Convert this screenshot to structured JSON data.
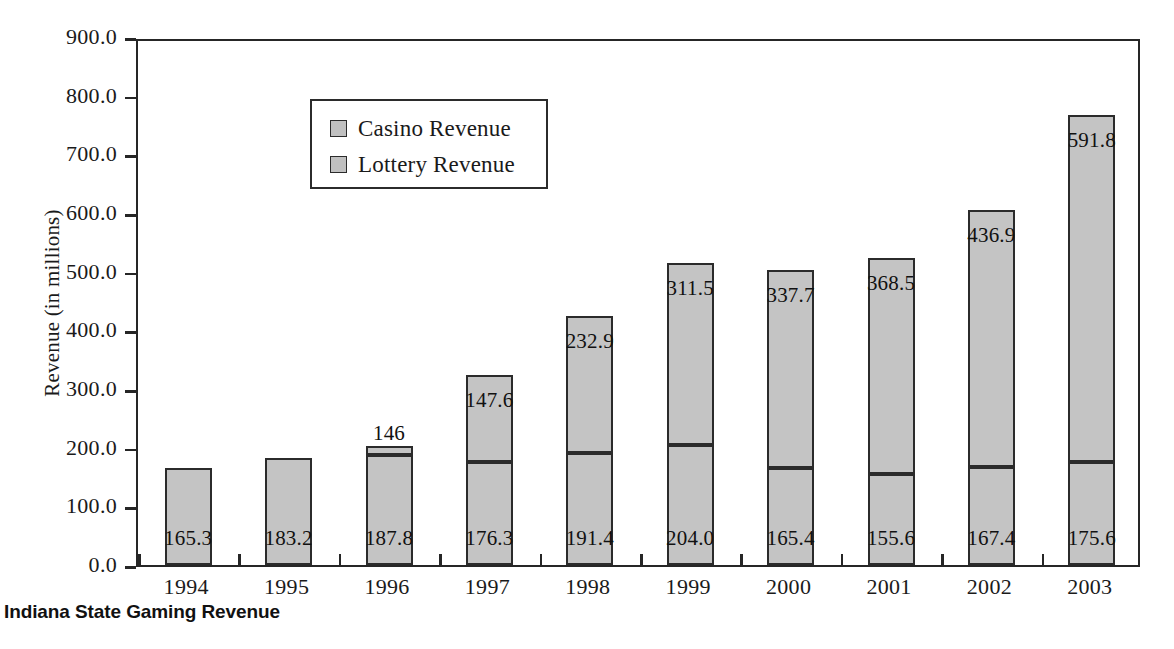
{
  "caption": "Indiana State Gaming Revenue",
  "legend": {
    "items": [
      {
        "label": "Casino Revenue",
        "color": "#c4c4c4"
      },
      {
        "label": "Lottery Revenue",
        "color": "#c4c4c4"
      }
    ]
  },
  "axes": {
    "ylabel": "Revenue (in millions)",
    "yticks": [
      "0.0",
      "100.0",
      "200.0",
      "300.0",
      "400.0",
      "500.0",
      "600.0",
      "700.0",
      "800.0",
      "900.0"
    ],
    "ytick_values": [
      0,
      100,
      200,
      300,
      400,
      500,
      600,
      700,
      800,
      900
    ],
    "xlabel": ""
  },
  "chart_data": {
    "type": "bar",
    "subtype": "stacked-vertical",
    "title": "Indiana State Gaming Revenue",
    "xlabel": "",
    "ylabel": "Revenue (in millions)",
    "ylim": [
      0,
      900
    ],
    "ytick_step": 100,
    "grid": false,
    "legend_position": "inside-top-left",
    "categories": [
      "1994",
      "1995",
      "1996",
      "1997",
      "1998",
      "1999",
      "2000",
      "2001",
      "2002",
      "2003"
    ],
    "series": [
      {
        "name": "Lottery Revenue",
        "values": [
          165.3,
          183.2,
          187.8,
          176.3,
          191.4,
          204.0,
          165.4,
          155.6,
          167.4,
          175.6
        ],
        "labels": [
          "165.3",
          "183.2",
          "187.8",
          "176.3",
          "191.4",
          "204.0",
          "165.4",
          "155.6",
          "167.4",
          "175.6"
        ]
      },
      {
        "name": "Casino Revenue",
        "values": [
          0,
          0,
          14.6,
          147.6,
          232.9,
          311.5,
          337.7,
          368.5,
          436.9,
          591.8
        ],
        "labels": [
          "",
          "",
          "146",
          "147.6",
          "232.9",
          "311.5",
          "337.7",
          "368.5",
          "436.9",
          "591.8"
        ],
        "label_outside": [
          false,
          false,
          true,
          false,
          false,
          false,
          false,
          false,
          false,
          false
        ]
      }
    ],
    "totals": [
      165.3,
      183.2,
      202.4,
      323.9,
      424.3,
      515.5,
      503.1,
      524.1,
      604.3,
      767.4
    ]
  },
  "colors": {
    "bar_fill": "#c4c4c4",
    "bar_stroke": "#2b2b2b",
    "axis": "#262626",
    "text": "#1a1a1a",
    "background": "#ffffff"
  }
}
